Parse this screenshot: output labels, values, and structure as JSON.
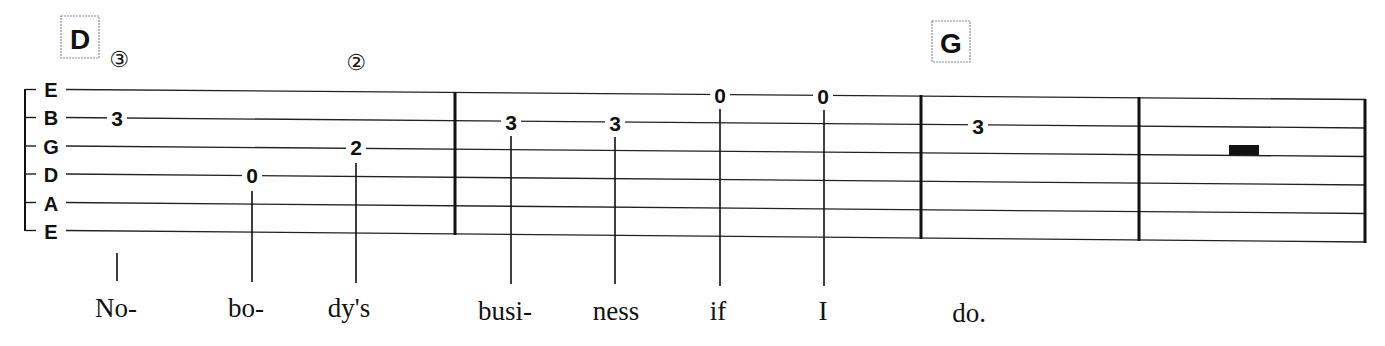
{
  "notation": {
    "type": "guitar-tablature",
    "strings": [
      "E",
      "B",
      "G",
      "D",
      "A",
      "E"
    ],
    "chords": [
      {
        "name": "D",
        "measure": 1
      },
      {
        "name": "G",
        "measure": 3
      }
    ],
    "string_indicators": [
      {
        "symbol": "③",
        "string_number": 3,
        "above_note": 1
      },
      {
        "symbol": "②",
        "string_number": 2,
        "above_note": 3
      }
    ],
    "measures": [
      {
        "number": 1,
        "notes": [
          {
            "string": "B",
            "fret": "3",
            "lyric": "No-"
          },
          {
            "string": "D",
            "fret": "0",
            "lyric": "bo-"
          },
          {
            "string": "G",
            "fret": "2",
            "lyric": "dy's"
          }
        ]
      },
      {
        "number": 2,
        "notes": [
          {
            "string": "B",
            "fret": "3",
            "lyric": "busi-"
          },
          {
            "string": "B",
            "fret": "3",
            "lyric": "ness"
          },
          {
            "string": "high E",
            "fret": "0",
            "lyric": "if"
          },
          {
            "string": "high E",
            "fret": "0",
            "lyric": "I"
          }
        ]
      },
      {
        "number": 3,
        "notes": [
          {
            "string": "B",
            "fret": "3",
            "lyric": "do."
          }
        ]
      },
      {
        "number": 4,
        "notes": [],
        "rest": "whole-rest"
      }
    ]
  }
}
